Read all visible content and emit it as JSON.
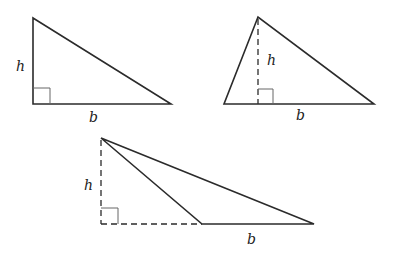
{
  "diagram": {
    "triangles": [
      {
        "type": "right",
        "height_label": "h",
        "base_label": "b",
        "vertices": [
          [
            33,
            18
          ],
          [
            33,
            104
          ],
          [
            171,
            104
          ]
        ],
        "height_line": "side",
        "right_angle_marker": [
          33,
          88,
          17
        ]
      },
      {
        "type": "acute",
        "height_label": "h",
        "base_label": "b",
        "vertices": [
          [
            258,
            17
          ],
          [
            224,
            104
          ],
          [
            374,
            104
          ]
        ],
        "height_line": "dashed-interior",
        "right_angle_marker": [
          258,
          89,
          15
        ]
      },
      {
        "type": "obtuse",
        "height_label": "h",
        "base_label": "b",
        "vertices": [
          [
            101,
            138
          ],
          [
            202,
            224
          ],
          [
            314,
            224
          ]
        ],
        "height_line": "dashed-exterior",
        "right_angle_marker": [
          101,
          208,
          17
        ]
      }
    ],
    "colors": {
      "stroke": "#2b2b2b",
      "marker": "#666666",
      "background": "#ffffff"
    }
  }
}
